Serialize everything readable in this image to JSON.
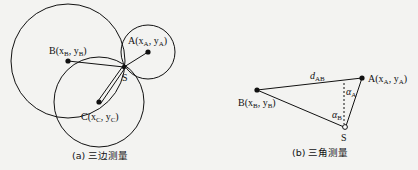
{
  "trilateration": {
    "caption": "(a) 三边测量",
    "label_A": "A(x",
    "label_A_sub": "A",
    "label_A_mid": ", y",
    "label_A_sub2": "A",
    "label_A_end": ")",
    "label_B": "B(x",
    "label_B_sub": "B",
    "label_B_mid": ", y",
    "label_B_sub2": "B",
    "label_B_end": ")",
    "label_C": "C(x",
    "label_C_sub": "C",
    "label_C_mid": ", y",
    "label_C_sub2": "C",
    "label_C_end": ")",
    "label_S": "S"
  },
  "triangulation": {
    "caption": "(b) 三角测量",
    "label_dAB": "d",
    "label_dAB_sub": "AB",
    "label_A": "A(x",
    "label_A_sub": "A",
    "label_A_mid": ", y",
    "label_A_sub2": "A",
    "label_A_end": ")",
    "label_B": "B(x",
    "label_B_sub": "B",
    "label_B_mid": ", y",
    "label_B_sub2": "B",
    "label_B_end": ")",
    "label_alphaA": "α",
    "label_alphaA_sub": "A",
    "label_alphaB": "α",
    "label_alphaB_sub": "B",
    "label_S": "S"
  }
}
